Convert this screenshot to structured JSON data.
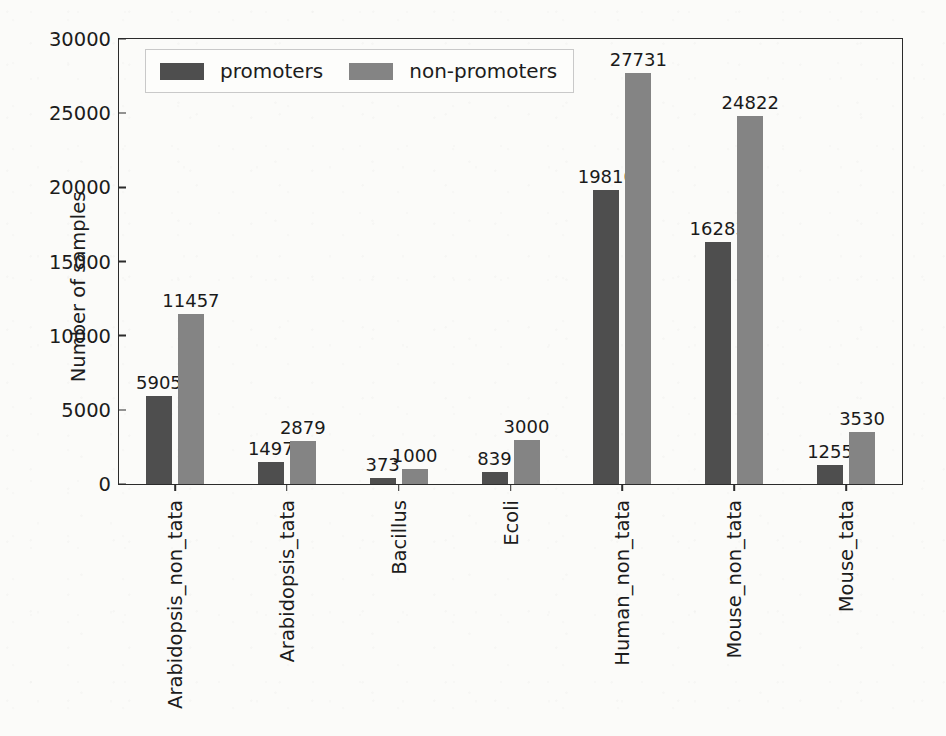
{
  "chart_data": {
    "type": "bar",
    "title": "",
    "subtitle": "",
    "xlabel": "",
    "ylabel": "Number of samples",
    "ylim": [
      0,
      30000
    ],
    "ytick_labels": [
      "0",
      "5000",
      "10000",
      "15000",
      "20000",
      "25000",
      "30000"
    ],
    "ytick_values": [
      0,
      5000,
      10000,
      15000,
      20000,
      25000,
      30000
    ],
    "grid": false,
    "legend_position": "upper left",
    "bar_orientation": "vertical",
    "value_labels_shown": true,
    "categories": [
      "Arabidopsis_non_tata",
      "Arabidopsis_tata",
      "Bacillus",
      "Ecoli",
      "Human_non_tata",
      "Mouse_non_tata",
      "Mouse_tata"
    ],
    "series": [
      {
        "name": "promoters",
        "color": "#4e4e4e",
        "values": [
          5905,
          1497,
          373,
          839,
          19810,
          16283,
          1255
        ],
        "value_labels": [
          "5905",
          "1497",
          "373",
          "839",
          "19810",
          "16283",
          "1255"
        ]
      },
      {
        "name": "non-promoters",
        "color": "#848484",
        "values": [
          11457,
          2879,
          1000,
          3000,
          27731,
          24822,
          3530
        ],
        "value_labels": [
          "11457",
          "2879",
          "1000",
          "3000",
          "27731",
          "24822",
          "3530"
        ]
      }
    ]
  },
  "colors": {
    "promoters": "#4e4e4e",
    "non_promoters": "#848484",
    "axis": "#2b2b2b",
    "text": "#1c1c1c",
    "background": "#fbfbf9"
  }
}
